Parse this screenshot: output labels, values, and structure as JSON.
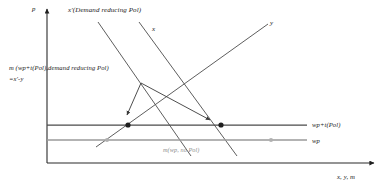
{
  "figure": {
    "type": "economics-line-diagram",
    "axes": {
      "y_axis_label": "p",
      "x_axis_label": "x, y, m"
    },
    "curves": [
      {
        "key": "x_prime",
        "label": "x'(Demand reducing Pol)",
        "slope": "downward",
        "color": "#555555"
      },
      {
        "key": "x",
        "label": "x",
        "slope": "downward",
        "color": "#555555"
      },
      {
        "key": "y",
        "label": "y",
        "slope": "upward",
        "color": "#555555"
      }
    ],
    "price_lines": [
      {
        "key": "wp_plus_t",
        "label": "wp+t(Pol)",
        "color": "#4a4a4a"
      },
      {
        "key": "wp",
        "label": "wp",
        "color": "#9a9a9a"
      }
    ],
    "annotations": [
      {
        "key": "m_policy",
        "line1": "m (wp+t(Pol),demand reducing Pol)",
        "line2": "=x'-y"
      },
      {
        "key": "m_no_policy",
        "label": "m(wp, no Pol)",
        "color": "#9a9a9a"
      }
    ],
    "markers": [
      {
        "key": "eq-left-dark",
        "style": "filled-dark"
      },
      {
        "key": "eq-right-dark",
        "style": "filled-dark"
      },
      {
        "key": "eq-left-gray",
        "style": "filled-gray"
      },
      {
        "key": "eq-right-gray",
        "style": "filled-gray"
      }
    ]
  }
}
